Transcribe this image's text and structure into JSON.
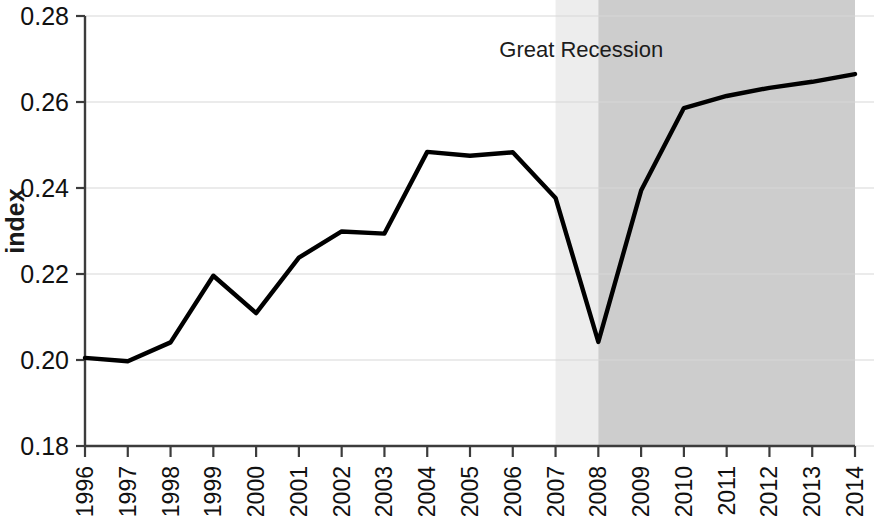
{
  "chart_data": {
    "type": "line",
    "title": "",
    "xlabel": "",
    "ylabel": "index",
    "x": [
      1996,
      1997,
      1998,
      1999,
      2000,
      2001,
      2002,
      2003,
      2004,
      2005,
      2006,
      2007,
      2008,
      2009,
      2010,
      2011,
      2012,
      2013,
      2014
    ],
    "values": [
      0.2005,
      0.1997,
      0.2041,
      0.2196,
      0.2109,
      0.2238,
      0.2299,
      0.2294,
      0.2484,
      0.2475,
      0.2483,
      0.2377,
      0.2042,
      0.2394,
      0.2586,
      0.2614,
      0.2633,
      0.2647,
      0.2665
    ],
    "series": [
      {
        "name": "index",
        "values": [
          0.2005,
          0.1997,
          0.2041,
          0.2196,
          0.2109,
          0.2238,
          0.2299,
          0.2294,
          0.2484,
          0.2475,
          0.2483,
          0.2377,
          0.2042,
          0.2394,
          0.2586,
          0.2614,
          0.2633,
          0.2647,
          0.2665
        ],
        "color": "#000000"
      }
    ],
    "categories": [
      "1996",
      "1997",
      "1998",
      "1999",
      "2000",
      "2001",
      "2002",
      "2003",
      "2004",
      "2005",
      "2006",
      "2007",
      "2008",
      "2009",
      "2010",
      "2011",
      "2012",
      "2013",
      "2014"
    ],
    "xlim": [
      1996,
      2014
    ],
    "ylim": [
      0.18,
      0.28
    ],
    "ytick_labels": [
      "0.28",
      "0.26",
      "0.24",
      "0.22",
      "0.20",
      "0.18"
    ],
    "ytick_values": [
      0.28,
      0.26,
      0.24,
      0.22,
      0.2,
      0.18
    ],
    "grid": true,
    "grid_axis": "y",
    "legend": "none",
    "annotations": [
      {
        "text": "Great Recession",
        "x": 2007.6,
        "y": 0.2705
      }
    ],
    "shaded_bands": [
      {
        "label": "pre-recession-light-band",
        "x_start": 2007.0,
        "x_end": 2008.0,
        "color": "#ededed"
      },
      {
        "label": "great-recession-band",
        "x_start": 2008.0,
        "x_end": 2014.0,
        "color": "#cdcdcd"
      }
    ],
    "colors": {
      "line": "#000000",
      "axis": "#3c3c3c",
      "grid": "#d7d7d7",
      "background": "#ffffff",
      "band_light": "#ededed",
      "band_dark": "#cdcdcd",
      "text": "#111111"
    }
  }
}
